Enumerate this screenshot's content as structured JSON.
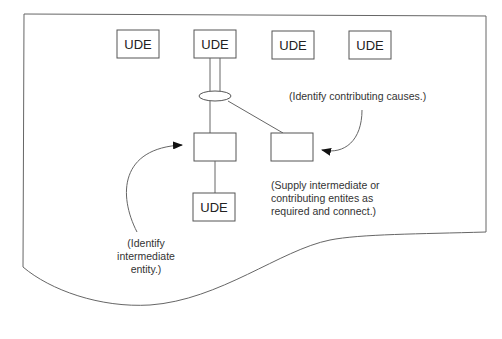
{
  "diagram": {
    "ude_label": "UDE",
    "top_udes": [
      "UDE",
      "UDE",
      "UDE",
      "UDE"
    ],
    "bottom_ude": "UDE",
    "notes": {
      "contributing": "(Identify contributing causes.)",
      "supply": [
        "(Supply intermediate or",
        "contributing entites as",
        "required and connect.)"
      ],
      "intermediate": [
        "(Identify",
        "intermediate",
        "entity.)"
      ]
    }
  }
}
